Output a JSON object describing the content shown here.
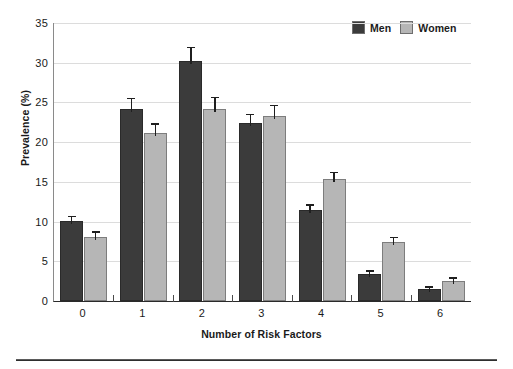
{
  "chart_data": {
    "type": "bar",
    "title": "",
    "xlabel": "Number of Risk Factors",
    "ylabel": "Prevalence (%)",
    "categories": [
      "0",
      "1",
      "2",
      "3",
      "4",
      "5",
      "6"
    ],
    "ylim": [
      0,
      35
    ],
    "yticks": [
      0,
      5,
      10,
      15,
      20,
      25,
      30,
      35
    ],
    "grid": true,
    "legend_position": "top-right",
    "series": [
      {
        "name": "Men",
        "color": "#3b3b3b",
        "values": [
          10.1,
          24.2,
          30.2,
          22.4,
          11.4,
          3.4,
          1.5
        ],
        "errors": [
          0.5,
          1.2,
          1.6,
          1.0,
          0.6,
          0.3,
          0.2
        ]
      },
      {
        "name": "Women",
        "color": "#b6b6b6",
        "values": [
          8.1,
          21.1,
          24.2,
          23.3,
          15.3,
          7.4,
          2.5
        ],
        "errors": [
          0.5,
          1.1,
          1.3,
          1.2,
          0.8,
          0.5,
          0.3
        ]
      }
    ]
  },
  "legend": {
    "entries": [
      {
        "label": "Men",
        "swatch": "#3b3b3b"
      },
      {
        "label": "Women",
        "swatch": "#b6b6b6"
      }
    ]
  },
  "axes": {
    "y_title": "Prevalence (%)",
    "x_title": "Number of Risk Factors",
    "y_tick_labels": [
      "35",
      "30",
      "25",
      "20",
      "15",
      "10",
      "5",
      "0"
    ],
    "x_tick_labels": [
      "0",
      "1",
      "2",
      "3",
      "4",
      "5",
      "6"
    ]
  }
}
